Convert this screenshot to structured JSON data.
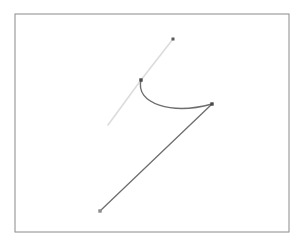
{
  "figure": {
    "title": "",
    "width": 304,
    "height": 246,
    "background_color": "#ffffff",
    "frame": {
      "name": "plot-border",
      "x": 15,
      "y": 14,
      "width": 274,
      "height": 218,
      "stroke_color": "#8a8a8a",
      "stroke_width": 1,
      "fill": "none"
    }
  },
  "chart_data": {
    "type": "scatter",
    "title": "",
    "xlabel": "",
    "ylabel": "",
    "grid": false,
    "legend": null,
    "xlim": [
      15,
      289
    ],
    "ylim": [
      232,
      14
    ],
    "axis_ticks_visible": false,
    "tick_labels": [],
    "annotations": [],
    "series": [
      {
        "name": "light-segment",
        "type": "line",
        "style": "straight",
        "color": "#dcdcdc",
        "stroke_width": 1.6,
        "points": [
          {
            "x": 108,
            "y": 125
          },
          {
            "x": 141,
            "y": 80
          },
          {
            "x": 173,
            "y": 39
          }
        ]
      },
      {
        "name": "dark-arc",
        "type": "line",
        "style": "curved",
        "color": "#6e6e6e",
        "stroke_width": 1.4,
        "points": [
          {
            "x": 141,
            "y": 80
          },
          {
            "x": 212,
            "y": 104
          }
        ],
        "control_points": [
          {
            "x": 135,
            "y": 104
          },
          {
            "x": 172,
            "y": 115
          }
        ]
      },
      {
        "name": "dark-segment",
        "type": "line",
        "style": "straight",
        "color": "#6e6e6e",
        "stroke_width": 1.3,
        "points": [
          {
            "x": 100,
            "y": 211
          },
          {
            "x": 212,
            "y": 104
          }
        ]
      }
    ],
    "markers": [
      {
        "name": "marker-top",
        "x": 173,
        "y": 39,
        "size": 3,
        "color": "#5a5a5a",
        "shape": "square"
      },
      {
        "name": "marker-junction",
        "x": 141,
        "y": 80,
        "size": 3.4,
        "color": "#4a4a4a",
        "shape": "square"
      },
      {
        "name": "marker-right",
        "x": 212,
        "y": 104,
        "size": 3.4,
        "color": "#4a4a4a",
        "shape": "square"
      },
      {
        "name": "marker-bottom-left",
        "x": 100,
        "y": 211,
        "size": 3.4,
        "color": "#8c8c8c",
        "shape": "square"
      }
    ]
  }
}
